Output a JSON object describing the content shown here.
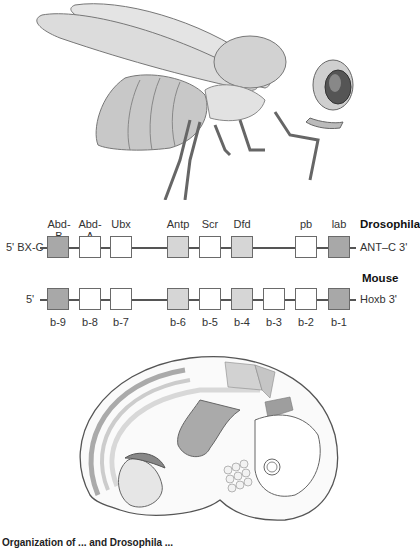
{
  "figure": {
    "colors": {
      "dark": "#a8a8a8",
      "light": "#d6d6d6",
      "white": "#ffffff"
    },
    "drosophila": {
      "species": "Drosophila",
      "left_end": "5' BX-C",
      "right_end": "ANT–C 3'",
      "genes": [
        {
          "name": "Abd-B",
          "shade": "dark"
        },
        {
          "name": "Abd-A",
          "shade": "white"
        },
        {
          "name": "Ubx",
          "shade": "white"
        },
        {
          "name": "Antp",
          "shade": "light"
        },
        {
          "name": "Scr",
          "shade": "white"
        },
        {
          "name": "Dfd",
          "shade": "light"
        },
        {
          "name": "pb",
          "shade": "white"
        },
        {
          "name": "lab",
          "shade": "dark"
        }
      ]
    },
    "mouse": {
      "species": "Mouse",
      "left_end": "5'",
      "right_end": "Hoxb 3'",
      "genes": [
        {
          "name": "b-9",
          "shade": "dark"
        },
        {
          "name": "b-8",
          "shade": "white"
        },
        {
          "name": "b-7",
          "shade": "white"
        },
        {
          "name": "b-6",
          "shade": "light"
        },
        {
          "name": "b-5",
          "shade": "white"
        },
        {
          "name": "b-4",
          "shade": "light"
        },
        {
          "name": "b-3",
          "shade": "white"
        },
        {
          "name": "b-2",
          "shade": "white"
        },
        {
          "name": "b-1",
          "shade": "dark"
        }
      ]
    },
    "caption": "Organization of ... and Drosophila ..."
  }
}
